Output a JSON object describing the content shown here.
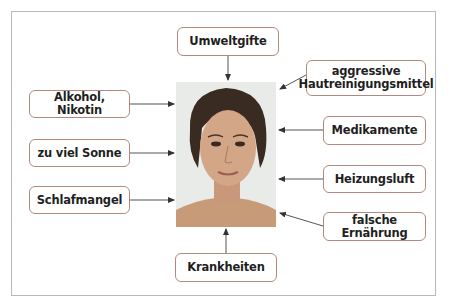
{
  "diagram": {
    "center": {
      "label": "portrait-photo",
      "description": "Frontal portrait of a young woman with short dark hair"
    },
    "top": [
      {
        "id": "umweltgifte",
        "label": "Umweltgifte"
      }
    ],
    "left": [
      {
        "id": "alkohol",
        "label": "Alkohol, Nikotin"
      },
      {
        "id": "sonne",
        "label": "zu viel Sonne"
      },
      {
        "id": "schlaf",
        "label": "Schlafmangel"
      }
    ],
    "right": [
      {
        "id": "aggressive",
        "label_line1": "aggressive",
        "label_line2": "Hautreinigungsmittel"
      },
      {
        "id": "medikamente",
        "label": "Medikamente"
      },
      {
        "id": "heizung",
        "label": "Heizungsluft"
      },
      {
        "id": "ernaehrung",
        "label": "falsche Ernährung"
      }
    ],
    "bottom": [
      {
        "id": "krankheiten",
        "label": "Krankheiten"
      }
    ]
  },
  "colors": {
    "box_border": "#b08a7e",
    "frame_border": "#b9b9b9",
    "arrow": "#333333",
    "text": "#1f1f1f"
  }
}
